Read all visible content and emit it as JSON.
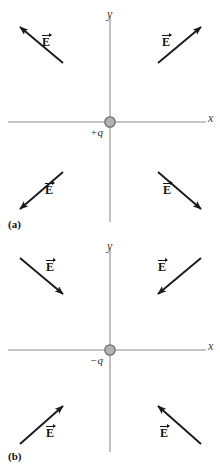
{
  "figure": {
    "caption_a": "(a)",
    "caption_b": "(b)",
    "axis_x_label": "x",
    "axis_y_label": "y",
    "field_label": "E",
    "axis_color": "#8c8c8c",
    "arrow_color": "#1a1a1a",
    "charge_fill": "#b3b3b3",
    "charge_stroke": "#6e6e6e",
    "text_color": "#1a1a1a"
  },
  "panels": [
    {
      "id": "a",
      "tag": "(a)",
      "charge_sign": "+",
      "charge_label": "+q",
      "charge_description": "positive point charge",
      "field_direction": "outward",
      "vectors": [
        {
          "quadrant": "upper-left",
          "label": "E",
          "points": "away-from-charge"
        },
        {
          "quadrant": "upper-right",
          "label": "E",
          "points": "away-from-charge"
        },
        {
          "quadrant": "lower-left",
          "label": "E",
          "points": "away-from-charge"
        },
        {
          "quadrant": "lower-right",
          "label": "E",
          "points": "away-from-charge"
        }
      ]
    },
    {
      "id": "b",
      "tag": "(b)",
      "charge_sign": "−",
      "charge_label": "−q",
      "charge_description": "negative point charge",
      "field_direction": "inward",
      "vectors": [
        {
          "quadrant": "upper-left",
          "label": "E",
          "points": "toward-charge"
        },
        {
          "quadrant": "upper-right",
          "label": "E",
          "points": "toward-charge"
        },
        {
          "quadrant": "lower-left",
          "label": "E",
          "points": "toward-charge"
        },
        {
          "quadrant": "lower-right",
          "label": "E",
          "points": "toward-charge"
        }
      ]
    }
  ]
}
